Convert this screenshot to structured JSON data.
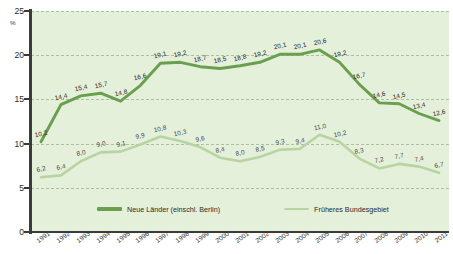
{
  "chart_data": {
    "type": "line",
    "title": "",
    "xlabel": "",
    "ylabel": "",
    "unit_label": "%",
    "grid": true,
    "legend_position": "bottom",
    "ylim": [
      0,
      25
    ],
    "yticks": [
      "0",
      "5",
      "10",
      "15",
      "20",
      "25"
    ],
    "categories": [
      "1991",
      "1992",
      "1993",
      "1994",
      "1995",
      "1996",
      "1997",
      "1998",
      "1999",
      "2000",
      "2001",
      "2002",
      "2003",
      "2004",
      "2005",
      "2006",
      "2007",
      "2008",
      "2009",
      "2010",
      "2011"
    ],
    "series": [
      {
        "name": "Neue Länder (einschl. Berlin)",
        "color": "#6a9f4f",
        "values": [
          10.2,
          14.4,
          15.4,
          15.7,
          14.8,
          16.6,
          19.1,
          19.2,
          18.7,
          18.5,
          18.8,
          19.2,
          20.1,
          20.1,
          20.6,
          19.2,
          16.7,
          14.6,
          14.5,
          13.4,
          12.6
        ],
        "labels": [
          "10,2",
          "14,4",
          "15,4",
          "15,7",
          "14,8",
          "16,6",
          "19,1",
          "19,2",
          "18,7",
          "18,5",
          "18,8",
          "19,2",
          "20,1",
          "20,1",
          "20,6",
          "19,2",
          "16,7",
          "14,6",
          "14,5",
          "13,4",
          "12,6"
        ]
      },
      {
        "name": "Früheres Bundesgebiet",
        "color": "#b9d4a3",
        "values": [
          6.2,
          6.4,
          8.0,
          9.0,
          9.1,
          9.9,
          10.8,
          10.3,
          9.6,
          8.4,
          8.0,
          8.5,
          9.3,
          9.4,
          11.0,
          10.2,
          8.3,
          7.2,
          7.7,
          7.4,
          6.7
        ],
        "labels": [
          "6,2",
          "6,4",
          "8,0",
          "9,0",
          "9,1",
          "9,9",
          "10,8",
          "10,3",
          "9,6",
          "8,4",
          "8,0",
          "8,5",
          "9,3",
          "9,4",
          "11,0",
          "10,2",
          "8,3",
          "7,2",
          "7,7",
          "7,4",
          "6,7"
        ]
      }
    ]
  },
  "style": {
    "panel_bg": "#e4f0da",
    "grid_color": "#aebfa0",
    "axis_color": "#3b3b3b"
  }
}
